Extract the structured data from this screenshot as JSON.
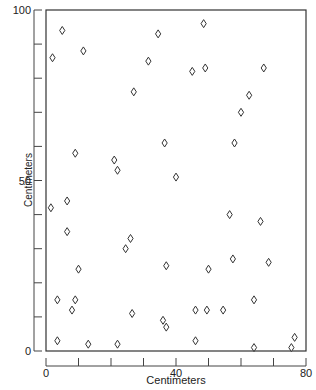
{
  "chart_data": {
    "type": "scatter",
    "title": "",
    "xlabel": "Centimeters",
    "ylabel": "Centimeters",
    "xlim": [
      0,
      80
    ],
    "ylim": [
      0,
      100
    ],
    "x_ticks": [
      0,
      10,
      20,
      30,
      40,
      50,
      60,
      70,
      80
    ],
    "x_tick_labels": [
      "0",
      "",
      "",
      "",
      "40",
      "",
      "",
      "",
      "80"
    ],
    "y_ticks": [
      0,
      10,
      20,
      30,
      40,
      50,
      60,
      70,
      80,
      90,
      100
    ],
    "y_tick_labels": [
      "0",
      "",
      "",
      "",
      "",
      "50",
      "",
      "",
      "",
      "",
      "100"
    ],
    "grid": false,
    "legend": null,
    "marker": "open-diamond",
    "points": [
      {
        "x": 1.5,
        "y": 42
      },
      {
        "x": 2,
        "y": 86
      },
      {
        "x": 3.5,
        "y": 15
      },
      {
        "x": 3.5,
        "y": 3
      },
      {
        "x": 5,
        "y": 94
      },
      {
        "x": 6.5,
        "y": 44
      },
      {
        "x": 6.5,
        "y": 35
      },
      {
        "x": 8,
        "y": 12
      },
      {
        "x": 9,
        "y": 58
      },
      {
        "x": 9,
        "y": 15
      },
      {
        "x": 10,
        "y": 24
      },
      {
        "x": 11.5,
        "y": 88
      },
      {
        "x": 13,
        "y": 2
      },
      {
        "x": 21,
        "y": 56
      },
      {
        "x": 22,
        "y": 53
      },
      {
        "x": 22,
        "y": 2
      },
      {
        "x": 24.5,
        "y": 30
      },
      {
        "x": 26,
        "y": 33
      },
      {
        "x": 26.5,
        "y": 11
      },
      {
        "x": 27,
        "y": 76
      },
      {
        "x": 31.5,
        "y": 85
      },
      {
        "x": 34.5,
        "y": 93
      },
      {
        "x": 36.5,
        "y": 61
      },
      {
        "x": 36,
        "y": 9
      },
      {
        "x": 37,
        "y": 25
      },
      {
        "x": 37,
        "y": 7
      },
      {
        "x": 40,
        "y": 51
      },
      {
        "x": 45,
        "y": 82
      },
      {
        "x": 46,
        "y": 12
      },
      {
        "x": 46,
        "y": 3
      },
      {
        "x": 48.5,
        "y": 96
      },
      {
        "x": 49,
        "y": 83
      },
      {
        "x": 49.5,
        "y": 12
      },
      {
        "x": 50,
        "y": 24
      },
      {
        "x": 54.5,
        "y": 12
      },
      {
        "x": 56.5,
        "y": 40
      },
      {
        "x": 57.5,
        "y": 27
      },
      {
        "x": 58,
        "y": 61
      },
      {
        "x": 60,
        "y": 70
      },
      {
        "x": 62.5,
        "y": 75
      },
      {
        "x": 64,
        "y": 15
      },
      {
        "x": 64,
        "y": 1
      },
      {
        "x": 66,
        "y": 38
      },
      {
        "x": 67,
        "y": 83
      },
      {
        "x": 68.5,
        "y": 26
      },
      {
        "x": 75.5,
        "y": 1
      },
      {
        "x": 76.5,
        "y": 4
      }
    ]
  },
  "axes": {
    "x_title": "Centimeters",
    "y_title": "Centimeters"
  }
}
